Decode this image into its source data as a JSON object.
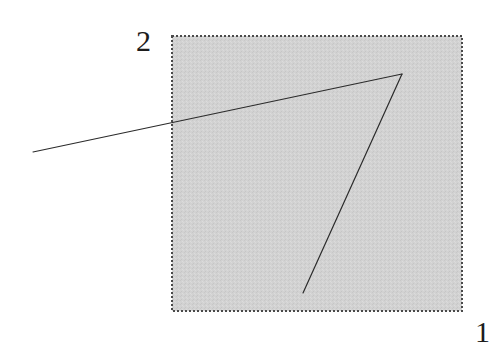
{
  "figure": {
    "title": "",
    "background_color": "#ffffff",
    "labels": [
      {
        "id": "region-2",
        "text": "2",
        "position": "top-left-outside",
        "x": 145,
        "y": 41,
        "color": "#1c1c1c"
      },
      {
        "id": "region-1",
        "text": "1",
        "position": "bottom-right-outside",
        "x": 483,
        "y": 332,
        "color": "#1c1c1c"
      }
    ],
    "shaded_region": {
      "name": "hatched-gray-rectangle",
      "shape": "rectangle",
      "x": 172,
      "y": 36,
      "width": 290,
      "height": 275,
      "fill_color": "#d2d2d2",
      "border_style": "dashed",
      "border_color": "#4a4a4a",
      "border_width": 1.4,
      "dash_pattern": "2 2"
    },
    "line_color": "#2b2b2b",
    "line_width": 1.2,
    "vertex": {
      "x": 402,
      "y": 74
    },
    "strokes": [
      {
        "name": "upper-ray",
        "from": {
          "x": 33,
          "y": 152
        },
        "to": {
          "x": 402,
          "y": 74
        },
        "crosses_region_edge_at": {
          "x": 172,
          "y": 124
        }
      },
      {
        "name": "lower-ray",
        "from": {
          "x": 402,
          "y": 74
        },
        "to": {
          "x": 303,
          "y": 293
        }
      }
    ]
  }
}
